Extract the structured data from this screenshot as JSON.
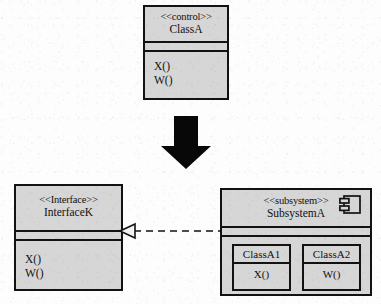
{
  "diagram": {
    "background_color": "#fdfdfd",
    "box_fill_color": "#d6d6d6",
    "line_color": "#121212"
  },
  "class_a": {
    "stereotype": "<<control>>",
    "name": "ClassA",
    "operations": [
      "X()",
      "W()"
    ]
  },
  "transform_arrow": {
    "icon": "down-arrow-icon",
    "direction": "down",
    "color": "#000000"
  },
  "interface": {
    "stereotype": "<<Interface>>",
    "name": "InterfaceK",
    "operations": [
      "X()",
      "W()"
    ]
  },
  "subsystem": {
    "stereotype": "<<subsystem>>",
    "name": "SubsystemA",
    "icon": "component-icon",
    "nested_classes": [
      {
        "name": "ClassA1",
        "operation": "X()"
      },
      {
        "name": "ClassA2",
        "operation": "W()"
      }
    ]
  },
  "realization": {
    "icon": "realization-arrow-icon",
    "line_style": "dashed",
    "arrowhead": "hollow-triangle",
    "points_to": "InterfaceK"
  }
}
